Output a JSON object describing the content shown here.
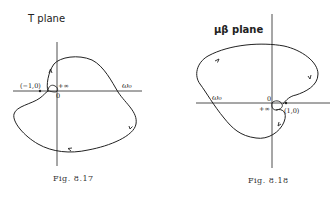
{
  "figures": [
    {
      "id": "fig-8-17",
      "title": "T plane",
      "caption": "Fig. 8.17",
      "labels": {
        "critical_point": "(−1,0)",
        "origin": "0",
        "infinity": "+∞",
        "omega": "ω₀"
      }
    },
    {
      "id": "fig-8-18",
      "title": "μβ plane",
      "caption": "Fig. 8.18",
      "labels": {
        "critical_point": "(1,0)",
        "origin": "0",
        "infinity": "+∞",
        "omega": "ω₀"
      }
    }
  ],
  "colors": {
    "ink": "#222222",
    "background": "#ffffff"
  }
}
